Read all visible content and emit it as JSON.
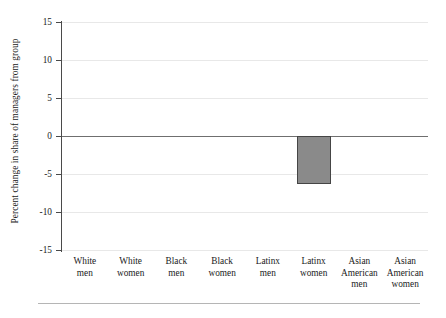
{
  "chart_data": {
    "type": "bar",
    "title": "",
    "subtitle": "",
    "xlabel": "",
    "ylabel": "Percent change in share of managers from group",
    "categories": [
      "White men",
      "White women",
      "Black men",
      "Black women",
      "Latinx men",
      "Latinx women",
      "Asian American men",
      "Asian American women"
    ],
    "category_lines": [
      [
        "White",
        "men"
      ],
      [
        "White",
        "women"
      ],
      [
        "Black",
        "men"
      ],
      [
        "Black",
        "women"
      ],
      [
        "Latinx",
        "men"
      ],
      [
        "Latinx",
        "women"
      ],
      [
        "Asian",
        "American",
        "men"
      ],
      [
        "Asian",
        "American",
        "women"
      ]
    ],
    "values": [
      0,
      0,
      0,
      0,
      0,
      -6.3,
      0,
      0
    ],
    "ylim": [
      -15,
      15
    ],
    "yticks": [
      15,
      10,
      5,
      0,
      -5,
      -10,
      -15
    ],
    "ytick_labels": [
      "15",
      "10",
      "5",
      "0",
      "-5",
      "-10",
      "-15"
    ],
    "grid": true,
    "legend": "none",
    "bar_fill_color": "#8a8a8a",
    "bar_edge_color": "#454545",
    "gridline_color": "#e8e8e8",
    "zero_line_color": "#6f6f6f",
    "axis_color": "#4a4a4a"
  }
}
